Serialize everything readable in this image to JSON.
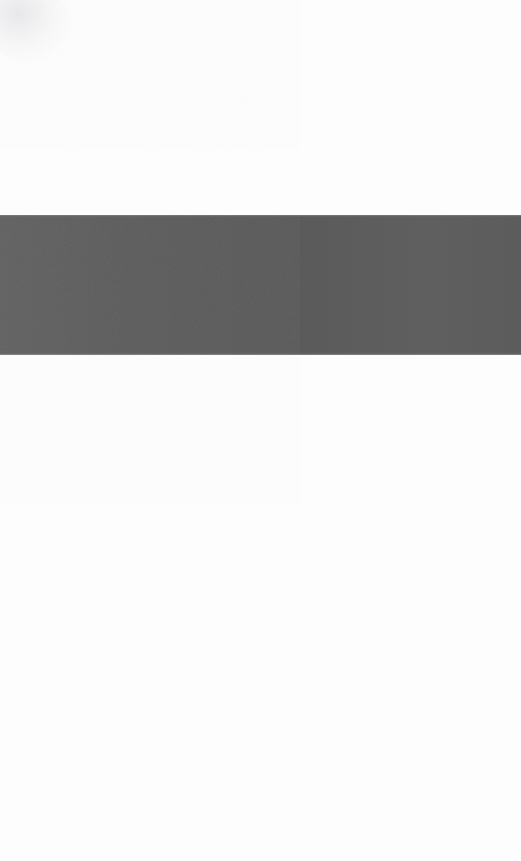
{
  "canvas": {
    "width": 521,
    "height": 861,
    "background_color": "#fdfdfd",
    "description": "Blank page with a single full-width dark gray horizontal band"
  },
  "regions": {
    "field_top": {
      "name": "upper-white-field",
      "top": 0,
      "height": 215,
      "color": "#fdfdfd"
    },
    "band": {
      "name": "gray-band",
      "top": 215,
      "height": 140,
      "left": 0,
      "width": 521,
      "color": "#5c5c5c",
      "edge_highlight_color": "#a4a4a4",
      "texture": "fine-grain"
    },
    "field_bottom": {
      "name": "lower-white-field",
      "top": 355,
      "height": 506,
      "color": "#fdfdfd"
    },
    "corner_smudge": {
      "name": "top-left-smudge",
      "color": "#e7e7e9"
    }
  }
}
